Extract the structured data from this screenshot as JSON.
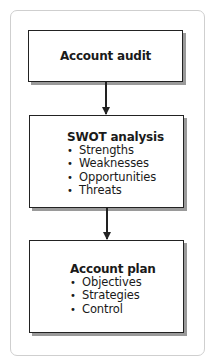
{
  "diagram": {
    "type": "flowchart",
    "nodes": [
      {
        "id": "account-audit",
        "title": "Account audit",
        "items": []
      },
      {
        "id": "swot-analysis",
        "title": "SWOT analysis",
        "items": [
          "Strengths",
          "Weaknesses",
          "Opportunities",
          "Threats"
        ]
      },
      {
        "id": "account-plan",
        "title": "Account plan",
        "items": [
          "Objectives",
          "Strategies",
          "Control"
        ]
      }
    ],
    "edges": [
      {
        "from": "account-audit",
        "to": "swot-analysis"
      },
      {
        "from": "swot-analysis",
        "to": "account-plan"
      }
    ],
    "bullet": "•"
  }
}
